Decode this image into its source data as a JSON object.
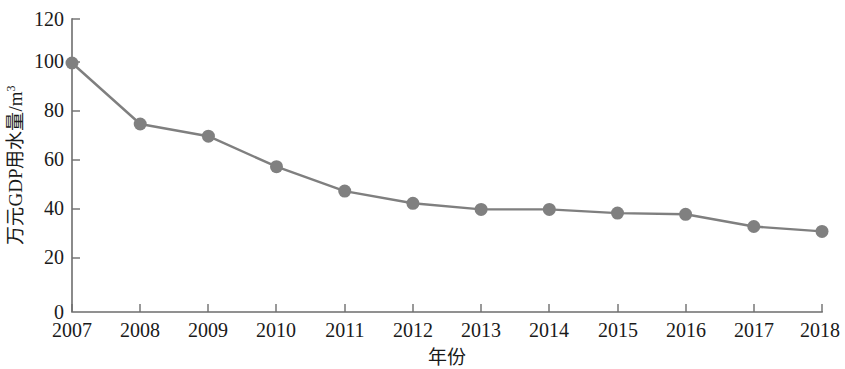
{
  "chart_data": {
    "type": "line",
    "title": "",
    "xlabel": "年份",
    "ylabel": "万元GDP用水量/m³",
    "ylabel_base": "万元GDP用水量/m",
    "ylabel_sup": "3",
    "categories": [
      "2007",
      "2008",
      "2009",
      "2010",
      "2011",
      "2012",
      "2013",
      "2014",
      "2015",
      "2016",
      "2017",
      "2018"
    ],
    "values": [
      102,
      77,
      72,
      59.5,
      49.5,
      44.5,
      42,
      42,
      40.5,
      40,
      35,
      33
    ],
    "series": [
      {
        "name": "万元GDP用水量",
        "values": [
          102,
          77,
          72,
          59.5,
          49.5,
          44.5,
          42,
          42,
          40.5,
          40,
          35,
          33
        ]
      }
    ],
    "ylim": [
      0,
      120
    ],
    "y_ticks": [
      "0",
      "20",
      "40",
      "60",
      "80",
      "100",
      "120"
    ],
    "y_tick_values": [
      0,
      20,
      40,
      60,
      80,
      100,
      120
    ],
    "x_ticks": [
      "2007",
      "2008",
      "2009",
      "2010",
      "2011",
      "2012",
      "2013",
      "2014",
      "2015",
      "2016",
      "2017",
      "2018"
    ],
    "grid": false,
    "legend": "none",
    "marker": "circle",
    "colors": {
      "line": "#7f7f7f",
      "marker": "#808080",
      "axis": "#6e6e6e",
      "text": "#1a1a1a",
      "background": "#ffffff"
    }
  }
}
